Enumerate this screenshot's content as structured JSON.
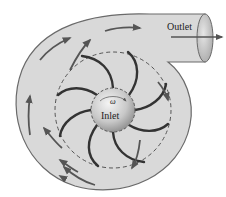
{
  "diagram": {
    "labels": {
      "outlet": "Outlet",
      "inlet": "Inlet",
      "omega": "ω"
    },
    "colors": {
      "casing_fill": "#d9d9d9",
      "casing_stroke": "#6a6a6a",
      "blade": "#333333",
      "arrow": "#555555",
      "hub_light": "#f2f2f2",
      "hub_dark": "#9a9a9a",
      "dashed_circle": "#555555"
    },
    "components": [
      "volute casing",
      "impeller blades",
      "hub (inlet)",
      "outlet pipe",
      "flow arrows"
    ],
    "blade_count": 8
  }
}
